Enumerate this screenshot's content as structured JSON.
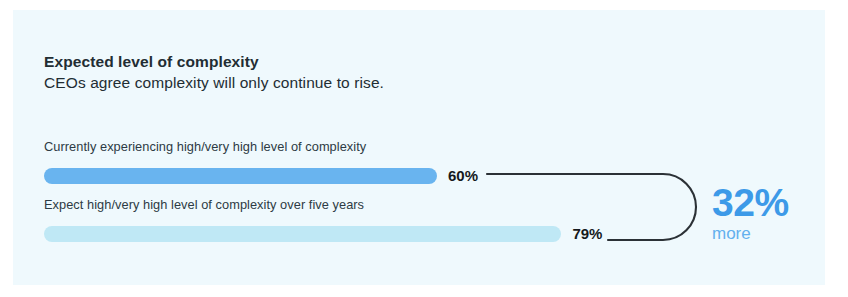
{
  "card": {
    "background": "#eff9fd",
    "page_background": "#ffffff"
  },
  "header": {
    "title": "Expected level of complexity",
    "subtitle": "CEOs agree complexity will only continue to rise."
  },
  "callout": {
    "value": "32%",
    "unit": "more",
    "value_color": "#3d9ae8",
    "unit_color": "#63b0ee"
  },
  "chart_data": {
    "type": "bar",
    "orientation": "horizontal",
    "title": "Expected level of complexity",
    "subtitle": "CEOs agree complexity will only continue to rise.",
    "xlabel": "",
    "ylabel": "",
    "xlim": [
      0,
      100
    ],
    "grid": false,
    "legend": false,
    "categories": [
      "Currently experiencing high/very high level of complexity",
      "Expect high/very high level of complexity over five years"
    ],
    "values": [
      60,
      79
    ],
    "value_labels": [
      "60%",
      "79%"
    ],
    "colors": [
      "#69b4ef",
      "#bfe8f5"
    ],
    "annotation": {
      "text": "32% more",
      "value": "32%",
      "unit": "more",
      "describes": "relative increase from 60% to 79%",
      "connector": "rounded-bracket"
    }
  }
}
